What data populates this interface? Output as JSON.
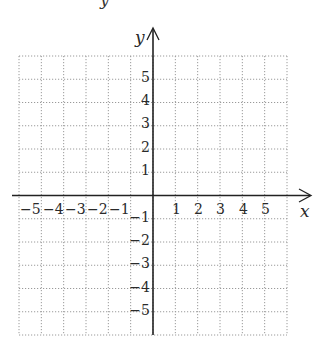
{
  "top_fragment": "y",
  "axes": {
    "x_label": "x",
    "y_label": "y",
    "x_ticks": [
      "-5",
      "-4",
      "-3",
      "-2",
      "-1",
      "1",
      "2",
      "3",
      "4",
      "5"
    ],
    "y_ticks": [
      "5",
      "4",
      "3",
      "2",
      "1",
      "-1",
      "-2",
      "-3",
      "-4",
      "-5"
    ]
  },
  "grid": {
    "x_range": [
      -6,
      6
    ],
    "y_range": [
      -6,
      6
    ],
    "step": 1,
    "line_style": "dotted",
    "line_color": "#9a9a9a",
    "axis_color": "#222222"
  }
}
